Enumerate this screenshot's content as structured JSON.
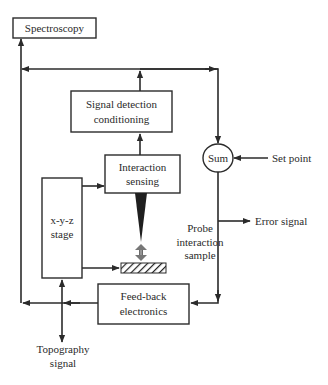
{
  "diagram": {
    "type": "block-diagram",
    "title": "",
    "blocks": {
      "spectroscopy": {
        "label": "Spectroscopy"
      },
      "signal_detection": {
        "line1": "Signal detection",
        "line2": "conditioning"
      },
      "interaction_sensing": {
        "line1": "Interaction",
        "line2": "sensing"
      },
      "stage": {
        "line1": "x-y-z",
        "line2": "stage"
      },
      "feedback": {
        "line1": "Feed-back",
        "line2": "electronics"
      },
      "sum": {
        "label": "Sum"
      }
    },
    "labels": {
      "set_point": "Set point",
      "error_signal": "Error signal",
      "probe_line1": "Probe",
      "probe_line2": "interaction",
      "probe_line3": "sample",
      "topography_line1": "Topography",
      "topography_line2": "signal"
    },
    "connections": [
      {
        "from": "interaction_sensing",
        "to": "signal_detection"
      },
      {
        "from": "signal_detection",
        "to": "sum"
      },
      {
        "from": "signal_detection",
        "to": "spectroscopy"
      },
      {
        "from": "set_point",
        "to": "sum"
      },
      {
        "from": "sum",
        "to": "error_signal"
      },
      {
        "from": "sum",
        "to": "feedback"
      },
      {
        "from": "feedback",
        "to": "stage"
      },
      {
        "from": "feedback",
        "to": "topography_signal"
      },
      {
        "from": "feedback",
        "to": "spectroscopy"
      },
      {
        "from": "stage",
        "to": "interaction_sensing"
      },
      {
        "from": "stage",
        "to": "sample"
      }
    ]
  }
}
